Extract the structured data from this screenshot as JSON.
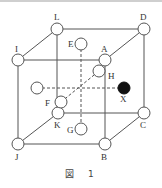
{
  "figure": {
    "caption_prefix": "図",
    "caption_number": "1",
    "stroke_color": "#555555",
    "filled_color": "#111111"
  },
  "nodes": {
    "A": {
      "label": "A",
      "x": 105,
      "y": 60,
      "filled": false
    },
    "B": {
      "label": "B",
      "x": 105,
      "y": 144,
      "filled": false
    },
    "C": {
      "label": "C",
      "x": 144,
      "y": 113,
      "filled": false
    },
    "D": {
      "label": "D",
      "x": 144,
      "y": 29,
      "filled": false
    },
    "E": {
      "label": "E",
      "x": 81,
      "y": 44,
      "filled": false
    },
    "F": {
      "label": "F",
      "x": 61,
      "y": 102,
      "filled": false
    },
    "G": {
      "label": "G",
      "x": 81,
      "y": 129,
      "filled": false
    },
    "H": {
      "label": "H",
      "x": 99,
      "y": 71,
      "filled": false
    },
    "I": {
      "label": "I",
      "x": 18,
      "y": 60,
      "filled": false
    },
    "J": {
      "label": "J",
      "x": 18,
      "y": 144,
      "filled": false
    },
    "K": {
      "label": "K",
      "x": 58,
      "y": 113,
      "filled": false
    },
    "L": {
      "label": "L",
      "x": 57,
      "y": 29,
      "filled": false
    },
    "unlabeled": {
      "label": "",
      "x": 37,
      "y": 88,
      "filled": false
    },
    "X": {
      "label": "X",
      "x": 124,
      "y": 88,
      "filled": true
    }
  },
  "edges_solid": [
    [
      "I",
      "A"
    ],
    [
      "A",
      "B"
    ],
    [
      "B",
      "J"
    ],
    [
      "J",
      "I"
    ],
    [
      "L",
      "D"
    ],
    [
      "D",
      "C"
    ],
    [
      "C",
      "K"
    ],
    [
      "K",
      "L"
    ],
    [
      "I",
      "L"
    ],
    [
      "A",
      "D"
    ],
    [
      "B",
      "C"
    ],
    [
      "J",
      "K"
    ]
  ],
  "edges_dashed": [
    [
      "E",
      "G"
    ],
    [
      "unlabeled",
      "X"
    ],
    [
      "F",
      "H"
    ]
  ]
}
